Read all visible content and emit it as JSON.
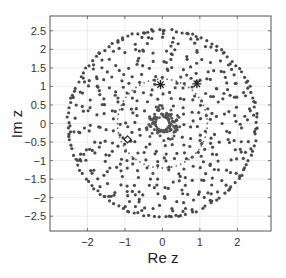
{
  "chart_data": {
    "type": "scatter",
    "title": "",
    "xlabel": "Re z",
    "ylabel": "Im z",
    "xlim": [
      -3.0,
      2.9
    ],
    "ylim": [
      -2.9,
      2.9
    ],
    "grid": true,
    "legend": "none",
    "xticks": [
      -2,
      -1,
      0,
      1,
      2
    ],
    "xtick_labels": [
      "−2",
      "−1",
      "0",
      "1",
      "2"
    ],
    "yticks": [
      2.5,
      2,
      1.5,
      1,
      0.5,
      0,
      -0.5,
      -1,
      -1.5,
      -2,
      -2.5
    ],
    "ytick_labels": [
      "2.5",
      "2",
      "1.5",
      "1",
      "0.5",
      "0",
      "−0.5",
      "−1",
      "−1.5",
      "−2",
      "−2.5"
    ],
    "colors": {
      "points": "#4a4a4a",
      "grid": "#e4e4e4",
      "frame": "#555555"
    },
    "series": [
      {
        "name": "eigenvalues-disk",
        "marker": "dot",
        "description": "quasi-uniform cloud filling disk of radius ~2.55",
        "radius_max": 2.55,
        "radius_min": 0.55,
        "count": 420
      },
      {
        "name": "eigenvalues-inner-ring",
        "marker": "dot",
        "description": "dense ring around central hole",
        "radius_min": 0.17,
        "radius_max": 0.5,
        "count": 130
      },
      {
        "name": "dotted-circle",
        "marker": "small-dot",
        "radius": 1.2,
        "count": 60
      }
    ],
    "special_points": [
      {
        "name": "star-1",
        "marker": "asterisk",
        "x": -0.05,
        "y": 1.05
      },
      {
        "name": "star-2",
        "marker": "asterisk",
        "x": 0.92,
        "y": 1.07
      },
      {
        "name": "diamond-1",
        "marker": "diamond",
        "x": -0.93,
        "y": -0.43
      }
    ],
    "center_hole_radius": 0.15
  }
}
